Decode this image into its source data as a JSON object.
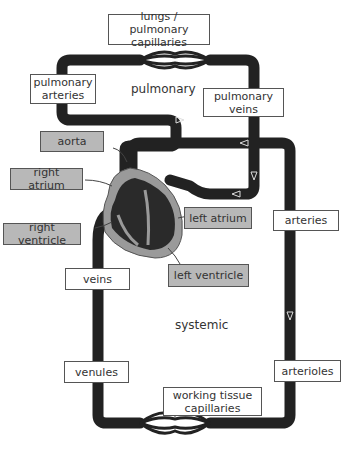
{
  "diagram": {
    "regions": {
      "pulmonary": "pulmonary",
      "systemic": "systemic"
    },
    "labels": {
      "lungs": "lungs / pulmonary capillaries",
      "pulmonary_arteries": "pulmonary arteries",
      "pulmonary_veins": "pulmonary veins",
      "aorta": "aorta",
      "right_atrium": "right atrium",
      "right_ventricle": "right ventricle",
      "left_atrium": "left atrium",
      "left_ventricle": "left ventricle",
      "arteries": "arteries",
      "veins": "veins",
      "venules": "venules",
      "arterioles": "arterioles",
      "tissue_capillaries": "working tissue capillaries"
    },
    "colors": {
      "vessel": "#222222",
      "heart_outer": "#9a9a9a",
      "heart_inner": "#2a2a2a",
      "grey_label": "#b8b8b8"
    }
  }
}
